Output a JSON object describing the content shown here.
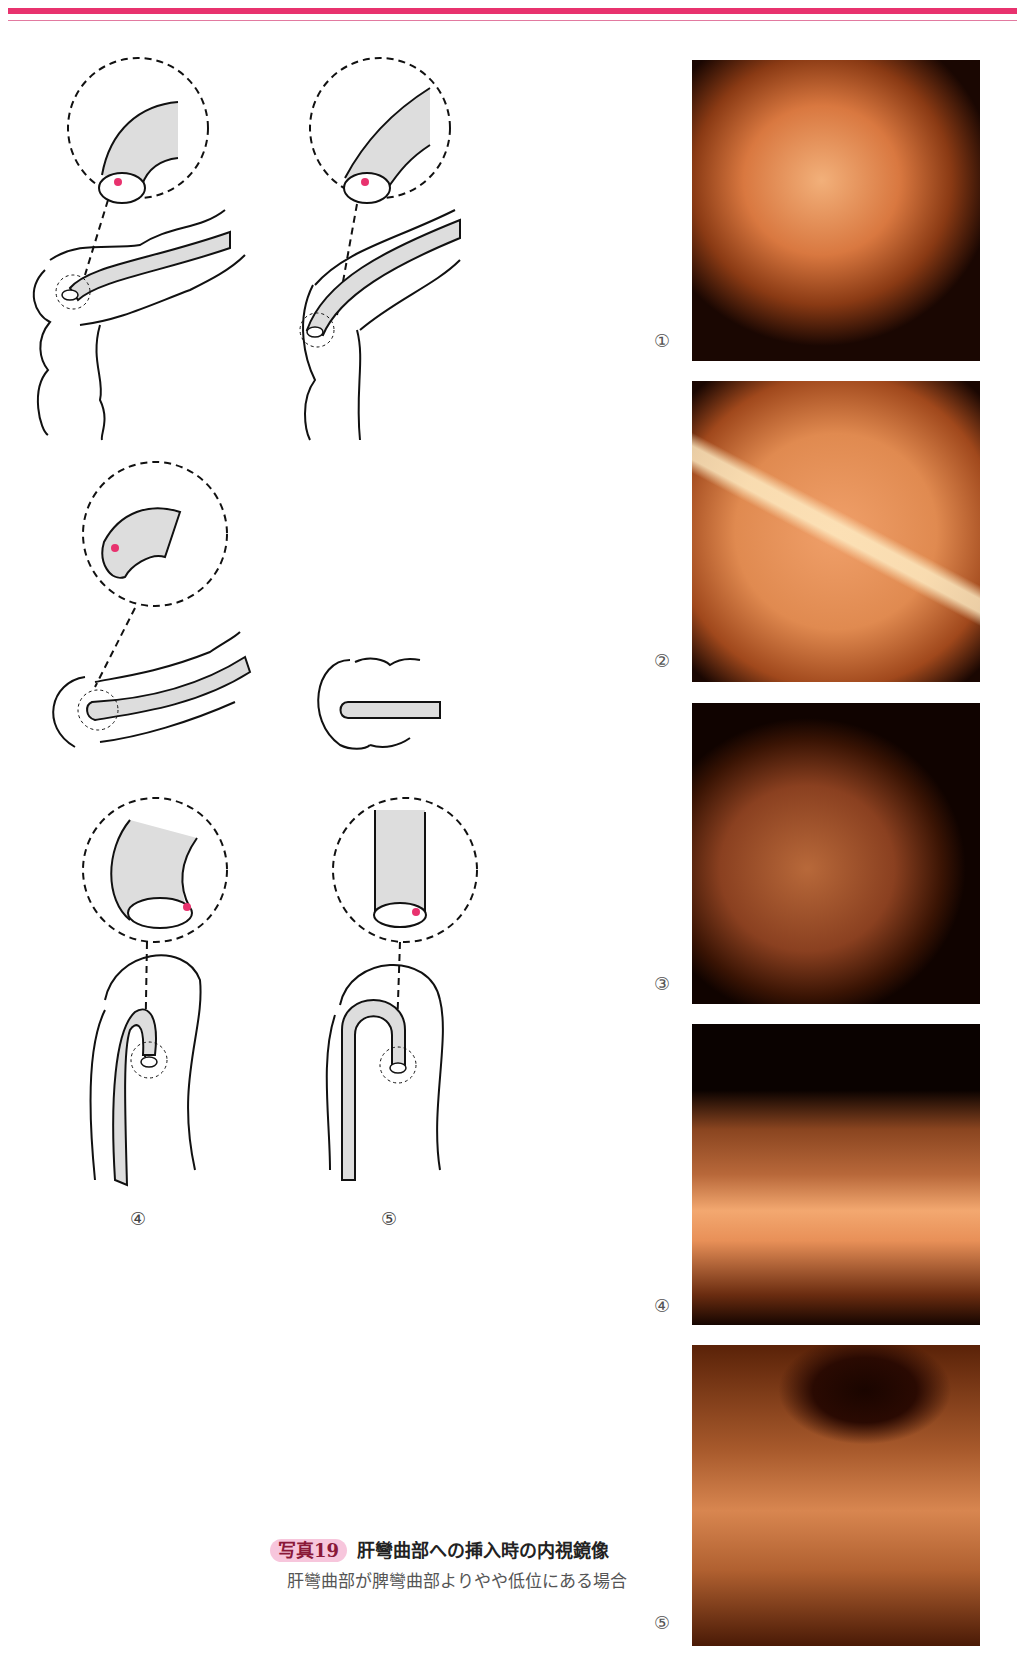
{
  "page": {
    "accent_color": "#e8326e"
  },
  "diagrams": {
    "bottom_labels": [
      "④",
      "⑤"
    ]
  },
  "photos": [
    {
      "label": "①",
      "description": "endoscopic view 1"
    },
    {
      "label": "②",
      "description": "endoscopic view 2"
    },
    {
      "label": "③",
      "description": "endoscopic view 3"
    },
    {
      "label": "④",
      "description": "endoscopic view 4"
    },
    {
      "label": "⑤",
      "description": "endoscopic view 5"
    }
  ],
  "caption": {
    "badge": "写真19",
    "title": "肝彎曲部への挿入時の内視鏡像",
    "body": "肝彎曲部が脾彎曲部よりやや低位にある場合"
  }
}
